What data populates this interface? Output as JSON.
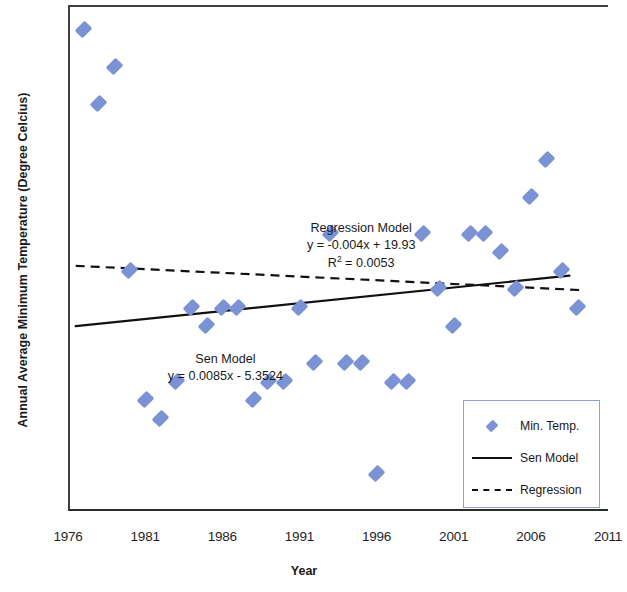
{
  "chart_data": {
    "type": "scatter",
    "title": "",
    "xlabel": "Year",
    "ylabel": "Annual Average Minimum Temperature (Degree Celcius)",
    "xlim": [
      1976,
      2011
    ],
    "ylim": [
      10.5,
      13.2
    ],
    "xticks": [
      1976,
      1981,
      1986,
      1991,
      1996,
      2001,
      2006,
      2011
    ],
    "yticks": [
      10.5,
      11.0,
      11.5,
      12.0,
      12.5,
      13.0
    ],
    "grid": false,
    "legend_position": "bottom-right",
    "series": [
      {
        "name": "Min. Temp.",
        "type": "scatter",
        "color": "#7b92d4",
        "marker": "diamond",
        "x": [
          1977,
          1978,
          1979,
          1980,
          1981,
          1982,
          1983,
          1984,
          1985,
          1986,
          1987,
          1988,
          1989,
          1990,
          1991,
          1992,
          1993,
          1994,
          1995,
          1996,
          1997,
          1998,
          1999,
          2000,
          2001,
          2002,
          2003,
          2004,
          2005,
          2006,
          2007,
          2008,
          2009
        ],
        "y": [
          13.1,
          12.7,
          12.9,
          11.8,
          11.1,
          11.0,
          11.2,
          11.6,
          11.5,
          11.6,
          11.6,
          11.1,
          11.2,
          11.2,
          11.6,
          11.3,
          12.0,
          11.3,
          11.3,
          10.7,
          11.2,
          11.2,
          12.0,
          11.7,
          11.5,
          12.0,
          12.0,
          11.9,
          11.7,
          12.2,
          12.4,
          11.8,
          11.6
        ]
      },
      {
        "name": "Sen Model",
        "type": "line",
        "style": "solid",
        "color": "#111111",
        "equation": "y = 0.0085x - 5.3524",
        "slope": 0.0085,
        "intercept": -5.3524,
        "x": [
          1976.5,
          2008.5
        ],
        "y": [
          11.4986,
          11.7706
        ]
      },
      {
        "name": "Regression",
        "type": "line",
        "style": "dashed",
        "color": "#111111",
        "equation": "y = -0.004x + 19.93",
        "slope": -0.004,
        "intercept": 19.93,
        "r_squared": 0.0053,
        "x": [
          1976.5,
          2009.5
        ],
        "y": [
          11.824,
          11.692
        ]
      }
    ],
    "annotations": [
      {
        "name": "regression-annotation",
        "lines": [
          "Regression Model",
          "y = -0.004x + 19.93",
          "R² = 0.0053"
        ],
        "x": 1995.0,
        "y": 12.02
      },
      {
        "name": "sen-annotation",
        "lines": [
          "Sen Model",
          "y = 0.0085x - 5.3524"
        ],
        "x": 1986.2,
        "y": 11.31
      }
    ]
  },
  "axis": {
    "y_tick_labels": [
      "13.0",
      "12.5",
      "12.0",
      "11.5",
      "11.0",
      "10.5"
    ],
    "x_tick_labels": [
      "1976",
      "1981",
      "1986",
      "1991",
      "1996",
      "2001",
      "2006",
      "2011"
    ],
    "y_title": "Annual Average Minimum Temperature (Degree Celcius)",
    "x_title": "Year"
  },
  "annotations": {
    "regression": {
      "line1": "Regression Model",
      "line2": "y = -0.004x + 19.93",
      "line3_prefix": "R",
      "line3_sup": "2",
      "line3_suffix": " = 0.0053"
    },
    "sen": {
      "line1": "Sen Model",
      "line2": "y = 0.0085x - 5.3524"
    }
  },
  "legend": {
    "items": [
      {
        "label": "Min. Temp.",
        "key": "diamond-marker"
      },
      {
        "label": "Sen Model",
        "key": "solid-line"
      },
      {
        "label": "Regression",
        "key": "dashed-line"
      }
    ]
  },
  "colors": {
    "marker": "#7b92d4",
    "line": "#111111",
    "legend_border": "#8ea0d8",
    "axis": "#3f3f3f"
  }
}
